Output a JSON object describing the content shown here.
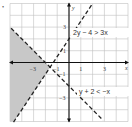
{
  "chart_data": {
    "type": "line",
    "title": "",
    "xlabel": "x",
    "ylabel": "y",
    "xlim": [
      -5,
      5
    ],
    "ylim": [
      -5,
      5
    ],
    "grid": true,
    "x_ticks": [
      "-3",
      "-1",
      "1",
      "3"
    ],
    "y_ticks": [
      "3",
      "1",
      "-1",
      "-3"
    ],
    "series": [
      {
        "name": "2y - 4 > 3x",
        "equation": "y = 1.5x + 2",
        "style": "dashed",
        "slope": 1.5,
        "intercept": 2
      },
      {
        "name": "y + 2 < -x",
        "equation": "y = -x - 2",
        "style": "dashed",
        "slope": -1,
        "intercept": -2
      }
    ],
    "shaded_region": "y > 1.5x + 2 and y < -x - 2 (left of intersection at (-1.6, -0.4))",
    "annotations": [
      "2y − 4 > 3x",
      "y + 2 < −x"
    ],
    "colors": {
      "shade": "#c8c8c8",
      "grid": "#bfbfbf",
      "lines": "#222222"
    }
  },
  "marker": "•"
}
